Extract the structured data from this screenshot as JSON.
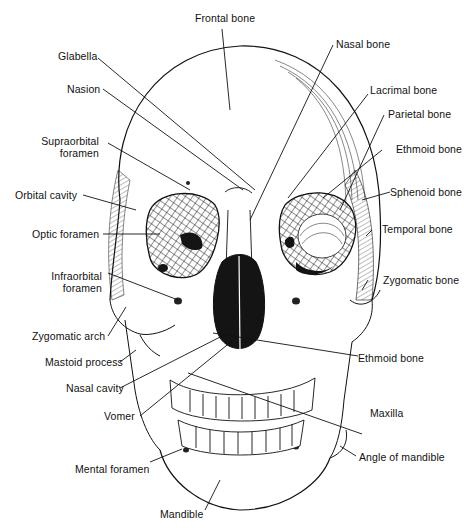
{
  "figure": {
    "colors": {
      "ink": "#111111",
      "background": "#ffffff",
      "cavity": "#141414"
    }
  },
  "labels": {
    "frontal_bone": "Frontal bone",
    "glabella": "Glabella",
    "nasion": "Nasion",
    "nasal_bone": "Nasal bone",
    "lacrimal_bone": "Lacrimal bone",
    "parietal_bone": "Parietal bone",
    "supraorbital_foramen_1": "Supraorbital",
    "supraorbital_foramen_2": "foramen",
    "ethmoid_bone_upper": "Ethmoid bone",
    "orbital_cavity": "Orbital cavity",
    "sphenoid_bone": "Sphenoid bone",
    "optic_foramen": "Optic foramen",
    "temporal_bone": "Temporal bone",
    "infraorbital_foramen_1": "Infraorbital",
    "infraorbital_foramen_2": "foramen",
    "zygomatic_bone": "Zygomatic bone",
    "zygomatic_arch": "Zygomatic arch",
    "mastoid_process": "Mastoid process",
    "ethmoid_bone_lower": "Ethmoid bone",
    "nasal_cavity": "Nasal cavity",
    "maxilla": "Maxilla",
    "vomer": "Vomer",
    "angle_of_mandible": "Angle of mandible",
    "mental_foramen": "Mental foramen",
    "mandible": "Mandible"
  }
}
